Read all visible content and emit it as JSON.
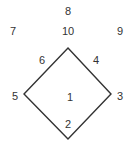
{
  "diagram": {
    "stroke_color": "#333333",
    "shape": {
      "type": "diamond",
      "points": [
        [
          68,
          48
        ],
        [
          111,
          94
        ],
        [
          68,
          139
        ],
        [
          24,
          94
        ]
      ]
    },
    "labels": [
      {
        "text": "8",
        "x": 68,
        "y": 11
      },
      {
        "text": "7",
        "x": 13,
        "y": 31
      },
      {
        "text": "10",
        "x": 68,
        "y": 31
      },
      {
        "text": "9",
        "x": 120,
        "y": 31
      },
      {
        "text": "6",
        "x": 42,
        "y": 60
      },
      {
        "text": "4",
        "x": 96,
        "y": 60
      },
      {
        "text": "5",
        "x": 15,
        "y": 96
      },
      {
        "text": "1",
        "x": 70,
        "y": 97
      },
      {
        "text": "3",
        "x": 120,
        "y": 96
      },
      {
        "text": "2",
        "x": 68,
        "y": 124
      }
    ]
  }
}
